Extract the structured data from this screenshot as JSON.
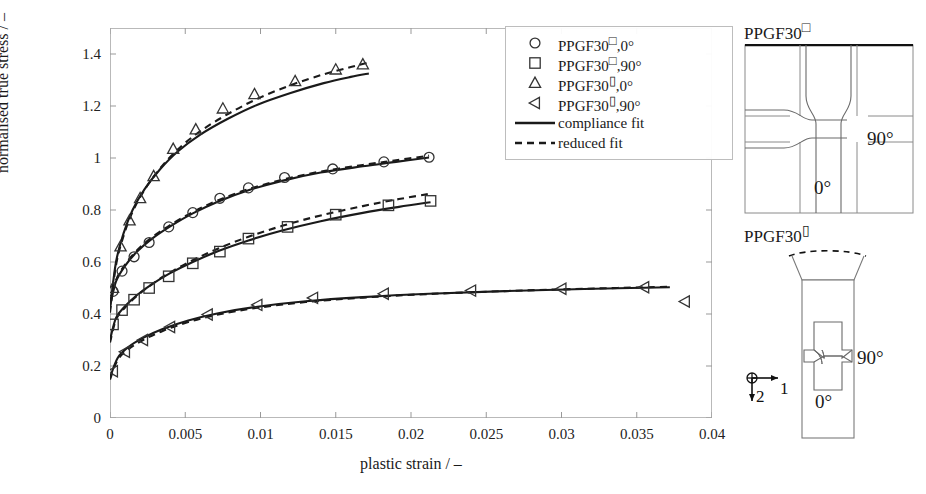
{
  "chart_data": {
    "type": "line",
    "title": "",
    "xlabel": "plastic strain / –",
    "ylabel": "normalised true stress / –",
    "xlim": [
      0,
      0.04
    ],
    "ylim": [
      0,
      1.5
    ],
    "xticks": [
      "0",
      "0.005",
      "0.01",
      "0.015",
      "0.02",
      "0.025",
      "0.03",
      "0.035",
      "0.04"
    ],
    "xtick_values": [
      0,
      0.005,
      0.01,
      0.015,
      0.02,
      0.025,
      0.03,
      0.035,
      0.04
    ],
    "yticks": [
      "0",
      "0.2",
      "0.4",
      "0.6",
      "0.8",
      "1",
      "1.2",
      "1.4"
    ],
    "ytick_values": [
      0,
      0.2,
      0.4,
      0.6,
      0.8,
      1.0,
      1.2,
      1.4
    ],
    "grid": false,
    "legend_position": "top-right",
    "series": [
      {
        "name": "PPGF30□,0°",
        "marker": "circle",
        "marker_points": [
          [
            0.0002,
            0.487
          ],
          [
            0.0008,
            0.565
          ],
          [
            0.0016,
            0.62
          ],
          [
            0.0026,
            0.675
          ],
          [
            0.0039,
            0.735
          ],
          [
            0.0055,
            0.79
          ],
          [
            0.0073,
            0.845
          ],
          [
            0.0092,
            0.885
          ],
          [
            0.0116,
            0.925
          ],
          [
            0.0148,
            0.958
          ],
          [
            0.0182,
            0.985
          ],
          [
            0.0212,
            1.003
          ]
        ],
        "compliance_fit": [
          [
            0.0,
            0.43
          ],
          [
            0.0004,
            0.525
          ],
          [
            0.001,
            0.585
          ],
          [
            0.0018,
            0.64
          ],
          [
            0.0028,
            0.69
          ],
          [
            0.004,
            0.737
          ],
          [
            0.0055,
            0.787
          ],
          [
            0.0072,
            0.833
          ],
          [
            0.0092,
            0.876
          ],
          [
            0.0115,
            0.913
          ],
          [
            0.014,
            0.944
          ],
          [
            0.0168,
            0.968
          ],
          [
            0.019,
            0.985
          ],
          [
            0.0212,
            1.002
          ]
        ],
        "reduced_fit": [
          [
            0.0,
            0.44
          ],
          [
            0.0004,
            0.53
          ],
          [
            0.001,
            0.59
          ],
          [
            0.0018,
            0.645
          ],
          [
            0.0028,
            0.695
          ],
          [
            0.004,
            0.742
          ],
          [
            0.0055,
            0.792
          ],
          [
            0.0072,
            0.838
          ],
          [
            0.0092,
            0.88
          ],
          [
            0.0115,
            0.917
          ],
          [
            0.014,
            0.948
          ],
          [
            0.0168,
            0.973
          ],
          [
            0.019,
            0.991
          ],
          [
            0.0212,
            1.009
          ]
        ]
      },
      {
        "name": "PPGF30□,90°",
        "marker": "square",
        "marker_points": [
          [
            0.0002,
            0.36
          ],
          [
            0.0008,
            0.415
          ],
          [
            0.0016,
            0.455
          ],
          [
            0.0026,
            0.5
          ],
          [
            0.0039,
            0.545
          ],
          [
            0.0055,
            0.595
          ],
          [
            0.0073,
            0.64
          ],
          [
            0.0092,
            0.69
          ],
          [
            0.0118,
            0.735
          ],
          [
            0.015,
            0.782
          ],
          [
            0.0185,
            0.818
          ],
          [
            0.0213,
            0.835
          ]
        ],
        "compliance_fit": [
          [
            0.0,
            0.3
          ],
          [
            0.0004,
            0.385
          ],
          [
            0.001,
            0.43
          ],
          [
            0.0018,
            0.473
          ],
          [
            0.0028,
            0.515
          ],
          [
            0.004,
            0.557
          ],
          [
            0.0055,
            0.6
          ],
          [
            0.0072,
            0.642
          ],
          [
            0.0092,
            0.683
          ],
          [
            0.0115,
            0.722
          ],
          [
            0.014,
            0.757
          ],
          [
            0.0168,
            0.789
          ],
          [
            0.0192,
            0.812
          ],
          [
            0.0213,
            0.83
          ]
        ],
        "reduced_fit": [
          [
            0.0,
            0.29
          ],
          [
            0.0004,
            0.378
          ],
          [
            0.001,
            0.425
          ],
          [
            0.0018,
            0.47
          ],
          [
            0.0028,
            0.515
          ],
          [
            0.004,
            0.56
          ],
          [
            0.0055,
            0.607
          ],
          [
            0.0072,
            0.652
          ],
          [
            0.0092,
            0.697
          ],
          [
            0.0115,
            0.74
          ],
          [
            0.014,
            0.779
          ],
          [
            0.0168,
            0.815
          ],
          [
            0.0192,
            0.842
          ],
          [
            0.0213,
            0.863
          ]
        ]
      },
      {
        "name": "PPGF30▯,0°",
        "marker": "triangle",
        "marker_points": [
          [
            0.0002,
            0.5
          ],
          [
            0.0007,
            0.66
          ],
          [
            0.0013,
            0.76
          ],
          [
            0.002,
            0.845
          ],
          [
            0.0029,
            0.93
          ],
          [
            0.0042,
            1.035
          ],
          [
            0.0057,
            1.11
          ],
          [
            0.0075,
            1.19
          ],
          [
            0.0096,
            1.245
          ],
          [
            0.0123,
            1.295
          ],
          [
            0.015,
            1.34
          ],
          [
            0.0168,
            1.36
          ]
        ],
        "compliance_fit": [
          [
            0.0,
            0.42
          ],
          [
            0.0004,
            0.6
          ],
          [
            0.0009,
            0.71
          ],
          [
            0.0015,
            0.8
          ],
          [
            0.0023,
            0.88
          ],
          [
            0.0033,
            0.955
          ],
          [
            0.0045,
            1.025
          ],
          [
            0.006,
            1.09
          ],
          [
            0.0078,
            1.15
          ],
          [
            0.0098,
            1.205
          ],
          [
            0.012,
            1.25
          ],
          [
            0.0142,
            1.288
          ],
          [
            0.016,
            1.312
          ],
          [
            0.0172,
            1.325
          ]
        ],
        "reduced_fit": [
          [
            0.0,
            0.405
          ],
          [
            0.0004,
            0.588
          ],
          [
            0.0009,
            0.7
          ],
          [
            0.0015,
            0.793
          ],
          [
            0.0023,
            0.878
          ],
          [
            0.0033,
            0.958
          ],
          [
            0.0045,
            1.033
          ],
          [
            0.006,
            1.103
          ],
          [
            0.0078,
            1.168
          ],
          [
            0.0098,
            1.228
          ],
          [
            0.012,
            1.28
          ],
          [
            0.0142,
            1.322
          ],
          [
            0.016,
            1.35
          ],
          [
            0.0172,
            1.368
          ]
        ]
      },
      {
        "name": "PPGF30▯,90°",
        "marker": "left-triangle",
        "marker_points": [
          [
            0.0002,
            0.18
          ],
          [
            0.001,
            0.255
          ],
          [
            0.0022,
            0.3
          ],
          [
            0.004,
            0.35
          ],
          [
            0.0065,
            0.398
          ],
          [
            0.0098,
            0.435
          ],
          [
            0.0135,
            0.462
          ],
          [
            0.0182,
            0.478
          ],
          [
            0.024,
            0.49
          ],
          [
            0.03,
            0.497
          ],
          [
            0.0355,
            0.503
          ],
          [
            0.0382,
            0.448
          ]
        ],
        "compliance_fit": [
          [
            0.0,
            0.155
          ],
          [
            0.0005,
            0.23
          ],
          [
            0.0012,
            0.272
          ],
          [
            0.0022,
            0.308
          ],
          [
            0.0035,
            0.342
          ],
          [
            0.0052,
            0.375
          ],
          [
            0.0072,
            0.403
          ],
          [
            0.0098,
            0.428
          ],
          [
            0.013,
            0.449
          ],
          [
            0.0168,
            0.465
          ],
          [
            0.0212,
            0.478
          ],
          [
            0.0262,
            0.488
          ],
          [
            0.0315,
            0.496
          ],
          [
            0.0372,
            0.503
          ]
        ],
        "reduced_fit": [
          [
            0.0,
            0.148
          ],
          [
            0.0005,
            0.222
          ],
          [
            0.0012,
            0.264
          ],
          [
            0.0022,
            0.3
          ],
          [
            0.0035,
            0.335
          ],
          [
            0.0052,
            0.369
          ],
          [
            0.0072,
            0.398
          ],
          [
            0.0098,
            0.424
          ],
          [
            0.013,
            0.446
          ],
          [
            0.0168,
            0.463
          ],
          [
            0.0212,
            0.477
          ],
          [
            0.0262,
            0.488
          ],
          [
            0.0315,
            0.497
          ],
          [
            0.0372,
            0.505
          ]
        ]
      }
    ]
  },
  "legend": {
    "items": [
      {
        "marker": "circle",
        "base": "PPGF30",
        "glyph": "□",
        "suffix": ",0°"
      },
      {
        "marker": "square",
        "base": "PPGF30",
        "glyph": "□",
        "suffix": ",90°"
      },
      {
        "marker": "triangle",
        "base": "PPGF30",
        "glyph": "▯",
        "suffix": ",0°"
      },
      {
        "marker": "left-triangle",
        "base": "PPGF30",
        "glyph": "▯",
        "suffix": ",90°"
      },
      {
        "marker": "solid-line",
        "base": "compliance fit",
        "glyph": "",
        "suffix": ""
      },
      {
        "marker": "dashed-line",
        "base": "reduced fit",
        "glyph": "",
        "suffix": ""
      }
    ]
  },
  "specimens": {
    "plate": {
      "title_base": "PPGF30",
      "title_glyph": "□",
      "label_0": "0°",
      "label_90": "90°"
    },
    "strip": {
      "title_base": "PPGF30",
      "title_glyph": "▯",
      "label_0": "0°",
      "label_90": "90°"
    },
    "axes_indicator": {
      "axis_1": "1",
      "axis_2": "2"
    }
  },
  "colors": {
    "line": "#1a1a1a",
    "marker": "#333333",
    "frame": "#b9b9b9",
    "tick": "#999999",
    "specimen_line": "#444444",
    "text": "#1a1a1a"
  }
}
